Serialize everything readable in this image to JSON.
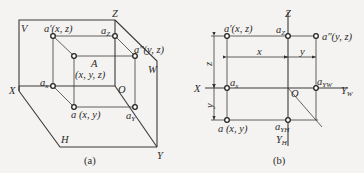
{
  "figure": {
    "panel_a": {
      "caption": "(a)",
      "planes": {
        "v": "V",
        "w": "W",
        "h": "H"
      },
      "axes": {
        "x": "X",
        "y": "Y",
        "z": "Z",
        "origin": "O"
      },
      "points": {
        "a_prime": "a′(x, z)",
        "a_z": "a",
        "a_z_sub": "Z",
        "a_double_prime": "a″(y, z)",
        "space_point": "A",
        "space_point_coords": "(x, y, z)",
        "a_x": "a",
        "a_x_sub": "x",
        "a_h": "a (x, y)",
        "a_y": "a",
        "a_y_sub": "Y"
      }
    },
    "panel_b": {
      "caption": "(b)",
      "axes": {
        "x": "X",
        "z": "Z",
        "origin": "O",
        "y_w": "Y",
        "y_w_sub": "W",
        "y_h": "Y",
        "y_h_sub": "H"
      },
      "points": {
        "a_prime": "a′(x, z)",
        "a_z": "a",
        "a_z_sub": "Z",
        "a_double_prime": "a″(y, z)",
        "a_x": "a",
        "a_x_sub": "x",
        "a_yw": "a",
        "a_yw_sub": "YW",
        "a_h": "a (x, y)",
        "a_yh": "a",
        "a_yh_sub": "YH"
      },
      "dimensions": {
        "x": "x",
        "y_top": "y",
        "z_left": "z",
        "y_left": "y"
      }
    }
  }
}
